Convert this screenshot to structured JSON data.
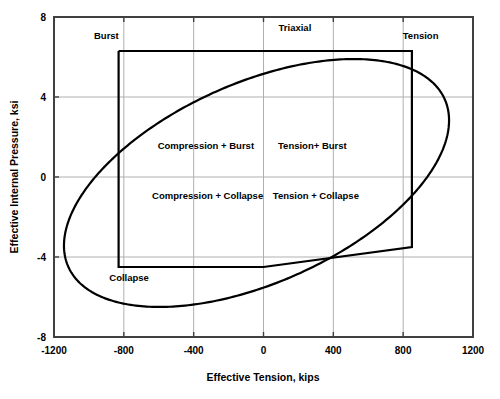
{
  "chart_data": {
    "type": "line",
    "title": "",
    "xlabel": "Effective Tension, kips",
    "ylabel": "Effective Internal Pressure, ksi",
    "xlim": [
      -1200,
      1200
    ],
    "ylim": [
      -8,
      8
    ],
    "xticks": [
      -1200,
      -800,
      -400,
      0,
      400,
      800,
      1200
    ],
    "yticks": [
      -8,
      -4,
      0,
      4,
      8
    ],
    "xtick_labels": [
      "-1200",
      "-800",
      "-400",
      "0",
      "400",
      "800",
      "1200"
    ],
    "ytick_labels": [
      "-8",
      "-4",
      "0",
      "4",
      "8"
    ],
    "grid": true,
    "legend": "none",
    "series": [
      {
        "name": "Triaxial",
        "shape": "ellipse",
        "description": "Rotated ellipse representing the triaxial (von Mises) design limit",
        "center": [
          -40,
          -0.3
        ],
        "semi_major": 1180,
        "semi_minor": 5.0,
        "rotation_deg": 24,
        "extreme_points": {
          "top_apex": [
            300,
            7.2
          ],
          "bottom_apex": [
            -400,
            -7.1
          ],
          "left_extreme": [
            -1005,
            -2.6
          ],
          "right_extreme": [
            990,
            3.0
          ]
        }
      },
      {
        "name": "Design envelope",
        "shape": "polygon",
        "description": "Rectangular burst / collapse / tension / compression operating envelope",
        "points": [
          [
            -830,
            6.3
          ],
          [
            850,
            6.3
          ],
          [
            850,
            -3.5
          ],
          [
            0,
            -4.5
          ],
          [
            -830,
            -4.5
          ],
          [
            -830,
            6.3
          ]
        ]
      }
    ],
    "annotations": [
      {
        "name": "triaxial-label",
        "text": "Triaxial",
        "x": 180,
        "y": 7.3
      },
      {
        "name": "burst-label",
        "text": "Burst",
        "x": -900,
        "y": 6.9
      },
      {
        "name": "tension-label",
        "text": "Tension",
        "x": 900,
        "y": 6.9
      },
      {
        "name": "collapse-label",
        "text": "Collapse",
        "x": -770,
        "y": -5.2
      },
      {
        "name": "compression-burst-label",
        "text": "Compression + Burst",
        "x": -330,
        "y": 1.4
      },
      {
        "name": "tension-burst-label",
        "text": "Tension+ Burst",
        "x": 280,
        "y": 1.4
      },
      {
        "name": "compression-collapse-label",
        "text": "Compression + Collapse",
        "x": -320,
        "y": -1.1
      },
      {
        "name": "tension-collapse-label",
        "text": "Tension + Collapse",
        "x": 300,
        "y": -1.1
      }
    ],
    "colors": {
      "curve": "#000000",
      "envelope": "#000000",
      "grid": "#b0b0b0",
      "frame": "#404040",
      "background": "#ffffff"
    }
  }
}
